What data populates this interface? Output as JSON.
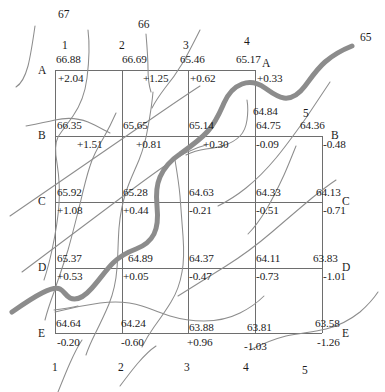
{
  "figure": {
    "type": "contour-grid-map",
    "grid": {
      "columns": [
        "1",
        "2",
        "3",
        "4",
        "5"
      ],
      "rows": [
        "A",
        "B",
        "C",
        "D",
        "E"
      ],
      "origin_px": {
        "x": 55,
        "y": 70
      },
      "cell_px": {
        "w": 66.75,
        "h": 65.75
      }
    },
    "colors": {
      "grid_line": "#6e6e6e",
      "contour_line": "#8a8a8a",
      "thick_contour": "#8c8c8c",
      "text": "#1a1a1a",
      "background": "#ffffff"
    },
    "nodes": [
      {
        "row": "A",
        "col": "1",
        "elevation": "66.88",
        "delta": "+2.04"
      },
      {
        "row": "A",
        "col": "2",
        "elevation": "66.69",
        "delta": "+1.25"
      },
      {
        "row": "A",
        "col": "3",
        "elevation": "65.46",
        "delta": "+0.62"
      },
      {
        "row": "A",
        "col": "4",
        "elevation": "65.17",
        "delta": "+0.33"
      },
      {
        "row": "B",
        "col": "1",
        "elevation": "66.35",
        "delta": "+1.51"
      },
      {
        "row": "B",
        "col": "2",
        "elevation": "65.65",
        "delta": "+0.81"
      },
      {
        "row": "B",
        "col": "3",
        "elevation": "65.14",
        "delta": "+0.30"
      },
      {
        "row": "B",
        "col": "4",
        "elevation": "64.75",
        "delta": "-0.09"
      },
      {
        "row": "B",
        "col": "5",
        "elevation": "64.36",
        "delta": "-0.48"
      },
      {
        "row": "C",
        "col": "1",
        "elevation": "65.92",
        "delta": "+1.08"
      },
      {
        "row": "C",
        "col": "2",
        "elevation": "65.28",
        "delta": "+0.44"
      },
      {
        "row": "C",
        "col": "3",
        "elevation": "64.63",
        "delta": "-0.21"
      },
      {
        "row": "C",
        "col": "4",
        "elevation": "64.33",
        "delta": "-0.51"
      },
      {
        "row": "C",
        "col": "5",
        "elevation": "64.13",
        "delta": "-0.71"
      },
      {
        "row": "D",
        "col": "1",
        "elevation": "65.37",
        "delta": "+0.53"
      },
      {
        "row": "D",
        "col": "2",
        "elevation": "64.89",
        "delta": "+0.05"
      },
      {
        "row": "D",
        "col": "3",
        "elevation": "64.37",
        "delta": "-0.47"
      },
      {
        "row": "D",
        "col": "4",
        "elevation": "64.11",
        "delta": "-0.73"
      },
      {
        "row": "D",
        "col": "5",
        "elevation": "63.83",
        "delta": "-1.01"
      },
      {
        "row": "E",
        "col": "1",
        "elevation": "64.64",
        "delta": "-0.20"
      },
      {
        "row": "E",
        "col": "2",
        "elevation": "64.24",
        "delta": "-0.60"
      },
      {
        "row": "E",
        "col": "3",
        "elevation": "63.88",
        "delta": "+0.96"
      },
      {
        "row": "E",
        "col": "4",
        "elevation": "63.81",
        "delta": "-1.03"
      },
      {
        "row": "E",
        "col": "5",
        "elevation": "63.58",
        "delta": "-1.26"
      },
      {
        "row": "A",
        "col": "extra",
        "elevation": "64.84",
        "delta": ""
      }
    ],
    "contour_labels": [
      {
        "text": "67",
        "x": 60,
        "y": 13
      },
      {
        "text": "66",
        "x": 137,
        "y": 25
      },
      {
        "text": "65",
        "x": 359,
        "y": 37
      },
      {
        "text": "5",
        "x": 302,
        "y": 114
      },
      {
        "text": "5",
        "x": 303,
        "y": 371
      }
    ],
    "extra_values": [
      {
        "text": "64.84",
        "x": 253,
        "y": 111
      }
    ],
    "axis_labels": {
      "columns_top": [
        {
          "text": "1",
          "x": 52,
          "y": 45
        },
        {
          "text": "2",
          "x": 118,
          "y": 45
        },
        {
          "text": "3",
          "x": 182,
          "y": 45
        },
        {
          "text": "4",
          "x": 243,
          "y": 45
        }
      ],
      "columns_bottom": [
        {
          "text": "1",
          "x": 52,
          "y": 364
        },
        {
          "text": "2",
          "x": 118,
          "y": 364
        },
        {
          "text": "3",
          "x": 182,
          "y": 364
        },
        {
          "text": "4",
          "x": 243,
          "y": 364
        }
      ],
      "rows_left": [
        {
          "text": "A",
          "x": 38,
          "y": 69
        },
        {
          "text": "B",
          "x": 38,
          "y": 134
        },
        {
          "text": "C",
          "x": 38,
          "y": 200
        },
        {
          "text": "D",
          "x": 38,
          "y": 266
        },
        {
          "text": "E",
          "x": 38,
          "y": 332
        }
      ],
      "rows_right": [
        {
          "text": "A",
          "x": 262,
          "y": 62
        },
        {
          "text": "B",
          "x": 330,
          "y": 134
        },
        {
          "text": "C",
          "x": 341,
          "y": 200
        },
        {
          "text": "D",
          "x": 341,
          "y": 266
        },
        {
          "text": "E",
          "x": 341,
          "y": 332
        }
      ]
    }
  }
}
